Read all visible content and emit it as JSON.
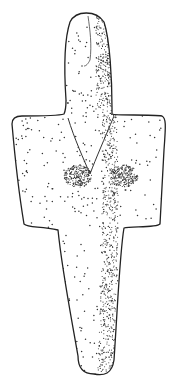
{
  "figure": {
    "subject": "Stippled drawing of a cruciform figurine",
    "style": "stipple-line-drawing",
    "background_color": "#ffffff",
    "ink_color": "#222222",
    "parts": [
      "head",
      "arms",
      "breasts",
      "neck-v-line",
      "lower-body"
    ]
  }
}
